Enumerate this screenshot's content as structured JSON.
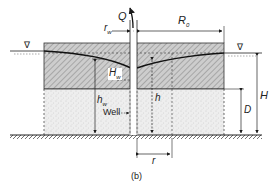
{
  "figure": {
    "caption": "(b)"
  },
  "labels": {
    "Q": "Q",
    "rw_main": "r",
    "rw_sub": "w",
    "R0_main": "R",
    "R0_sub": "0",
    "Hw_main": "H",
    "Hw_sub": "w",
    "hw_main": "h",
    "hw_sub": "w",
    "h": "h",
    "well": "Well",
    "H": "H",
    "D": "D",
    "r": "r",
    "water_table_symbol": "∇"
  },
  "colors": {
    "line": "#1a1a1a",
    "hatch_bg": "#cfcfcf",
    "hatch_line": "#8a8a8a",
    "stipple_bg": "#ececec",
    "stipple_dot": "#b5b5b5"
  }
}
